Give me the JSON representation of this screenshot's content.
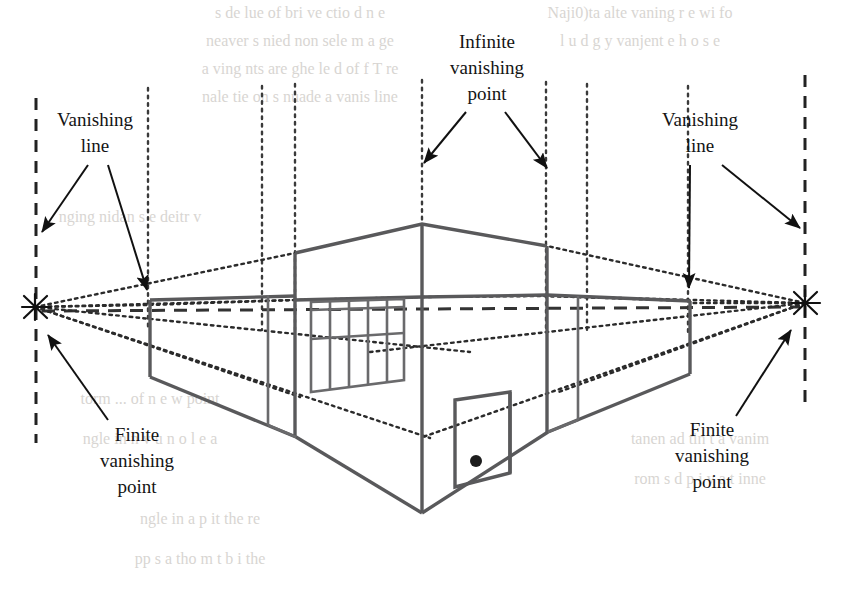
{
  "figure": {
    "background_color": "#ffffff",
    "ink_color": "#59595b",
    "label_color": "#141414"
  },
  "labels": {
    "vanishing_line_left": {
      "line1": "Vanishing",
      "line2": "line"
    },
    "vanishing_line_right": {
      "line1": "Vanishing",
      "line2": "line"
    },
    "infinite_vanishing_point": {
      "line1": "Infinite",
      "line2": "vanishing",
      "line3": "point"
    },
    "finite_vanishing_point_left": {
      "line1": "Finite",
      "line2": "vanishing",
      "line3": "point"
    },
    "finite_vanishing_point_right": {
      "line1": "Finite",
      "line2": "vanishing",
      "line3": "point"
    }
  },
  "geometry": {
    "left_vanishing_point": {
      "x": 35,
      "y": 307
    },
    "right_vanishing_point": {
      "x": 805,
      "y": 303
    },
    "left_vanishing_line_x": 36,
    "right_vanishing_line_x": 805,
    "horizon_y": 312,
    "roof_apex": {
      "x": 422,
      "y": 224
    },
    "door_handle": {
      "x": 476,
      "y": 461
    },
    "window_panel_count": 5
  },
  "bleed_text": {
    "note": "faint show-through text from the reverse side of the printed page",
    "lines": [
      "s de lue of bri ve ctio d n e",
      "neaver s nied non sele m a ge",
      "a ving nts are ghe le d of f T re",
      "nale tie on s nuade a vanis line",
      "Naji0)ta alte vaning r e wi fo",
      "l u d g y vanjent e h o s e",
      "nging nidan s e deitr v",
      "torm ... of n e w point",
      "ngle in n v u n o l e a",
      "tanen ad tin t a vanim",
      "rom s d p i v a t inne",
      "ngle in a p it the re",
      "pp s a tho m t b i the"
    ]
  }
}
